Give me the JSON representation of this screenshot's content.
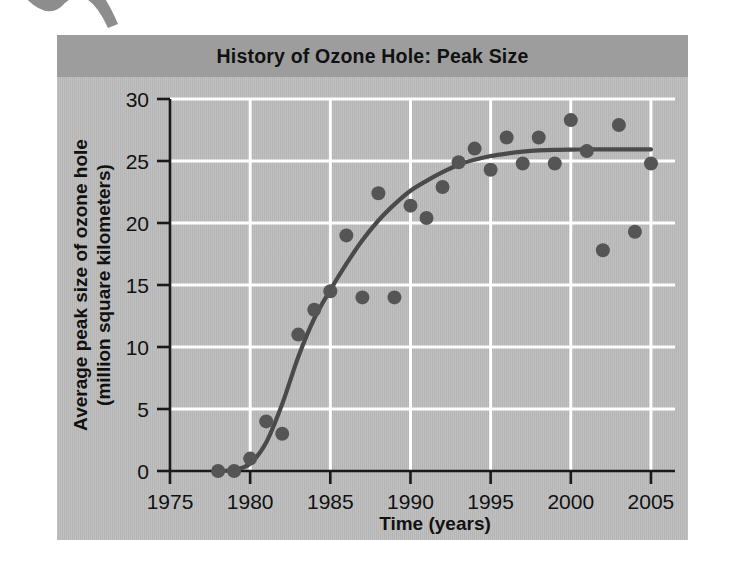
{
  "figure": {
    "title": "History of Ozone Hole: Peak Size",
    "title_band_color": "#9d9d9d",
    "panel_color": "#bcbcbc",
    "gridline_color": "#ffffff",
    "axis_color": "#1a1a1a",
    "marker_color": "#555555",
    "trendline_color": "#4a4a4a",
    "artifact": "corner-chevron-mark"
  },
  "chart_data": {
    "type": "scatter",
    "title": "History of Ozone Hole: Peak Size",
    "xlabel": "Time (years)",
    "ylabel": "Average peak size of ozone hole (million square kilometers)",
    "ylabel_line1": "Average peak size of ozone hole",
    "ylabel_line2": "(million square kilometers)",
    "xlim": [
      1975,
      2006.5
    ],
    "ylim": [
      0,
      30
    ],
    "xticks": [
      1975,
      1980,
      1985,
      1990,
      1995,
      2000,
      2005
    ],
    "xtick_labels": [
      "1975",
      "1980",
      "1985",
      "1990",
      "1995",
      "2000",
      "2005"
    ],
    "yticks": [
      0,
      5,
      10,
      15,
      20,
      25,
      30
    ],
    "ytick_labels": [
      "0",
      "5",
      "10",
      "15",
      "20",
      "25",
      "30"
    ],
    "grid": true,
    "grid_axis": "both",
    "legend": false,
    "marker_style": "filled-circle",
    "marker_radius": 7,
    "x": [
      1978,
      1979,
      1980,
      1981,
      1982,
      1983,
      1984,
      1985,
      1986,
      1987,
      1988,
      1989,
      1990,
      1991,
      1992,
      1993,
      1994,
      1995,
      1996,
      1997,
      1998,
      1999,
      2000,
      2001,
      2002,
      2003,
      2004,
      2005
    ],
    "values": [
      0.0,
      0.0,
      1.0,
      4.0,
      3.0,
      11.0,
      13.0,
      14.5,
      19.0,
      14.0,
      22.4,
      14.0,
      21.4,
      20.4,
      22.9,
      24.9,
      26.0,
      24.3,
      26.9,
      24.8,
      26.9,
      24.8,
      28.3,
      25.8,
      17.8,
      27.9,
      19.3,
      24.8
    ],
    "series": [
      {
        "name": "Average peak size of ozone hole",
        "type": "scatter",
        "x": [
          1978,
          1979,
          1980,
          1981,
          1982,
          1983,
          1984,
          1985,
          1986,
          1987,
          1988,
          1989,
          1990,
          1991,
          1992,
          1993,
          1994,
          1995,
          1996,
          1997,
          1998,
          1999,
          2000,
          2001,
          2002,
          2003,
          2004,
          2005
        ],
        "values": [
          0.0,
          0.0,
          1.0,
          4.0,
          3.0,
          11.0,
          13.0,
          14.5,
          19.0,
          14.0,
          22.4,
          14.0,
          21.4,
          20.4,
          22.9,
          24.9,
          26.0,
          24.3,
          26.9,
          24.8,
          26.9,
          24.8,
          28.3,
          25.8,
          17.8,
          27.9,
          19.3,
          24.8
        ]
      },
      {
        "name": "Fitted trend curve",
        "type": "line",
        "x": [
          1978,
          1979,
          1980,
          1981,
          1982,
          1983,
          1984,
          1985,
          1986,
          1987,
          1988,
          1989,
          1990,
          1991,
          1992,
          1993,
          1994,
          1995,
          1996,
          1997,
          1998,
          1999,
          2000,
          2001,
          2002,
          2003,
          2004,
          2005
        ],
        "values": [
          0.0,
          0.1,
          0.6,
          2.3,
          5.4,
          9.2,
          12.3,
          14.6,
          16.7,
          18.6,
          20.2,
          21.5,
          22.6,
          23.4,
          24.1,
          24.7,
          25.1,
          25.4,
          25.6,
          25.75,
          25.85,
          25.9,
          25.92,
          25.93,
          25.93,
          25.93,
          25.93,
          25.93
        ]
      }
    ]
  }
}
